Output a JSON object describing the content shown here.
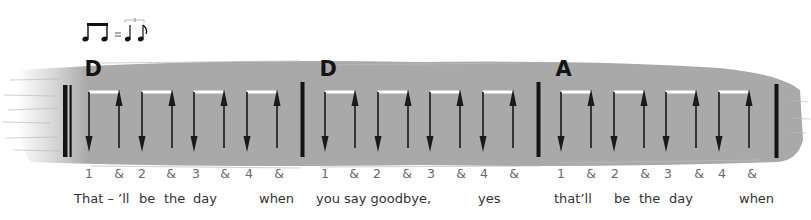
{
  "swing_notation": {
    "description": "two beamed eighth notes = triplet quarter + eighth (swing feel)",
    "equals": "=",
    "triplet_number": "3"
  },
  "colors": {
    "band": "#a9a9a9",
    "barline": "#141414",
    "arrow": "#1a1a1a",
    "beam": "#ffffff",
    "count_text": "#6a6a6a",
    "lyric_text": "#333333"
  },
  "measures": [
    {
      "chord": "D",
      "counts": [
        "1",
        "&",
        "2",
        "&",
        "3",
        "&",
        "4",
        "&"
      ],
      "strums": [
        "down",
        "up",
        "down",
        "up",
        "down",
        "up",
        "down",
        "up"
      ]
    },
    {
      "chord": "D",
      "counts": [
        "1",
        "&",
        "2",
        "&",
        "3",
        "&",
        "4",
        "&"
      ],
      "strums": [
        "down",
        "up",
        "down",
        "up",
        "down",
        "up",
        "down",
        "up"
      ]
    },
    {
      "chord": "A",
      "counts": [
        "1",
        "&",
        "2",
        "&",
        "3",
        "&",
        "4",
        "&"
      ],
      "strums": [
        "down",
        "up",
        "down",
        "up",
        "down",
        "up",
        "down",
        "up"
      ]
    }
  ],
  "lyrics": [
    "That – ’ll",
    "be",
    "the",
    "day",
    "when",
    "you say goodbye,",
    "yes",
    "that’ll",
    "be",
    "the",
    "day",
    "when"
  ]
}
